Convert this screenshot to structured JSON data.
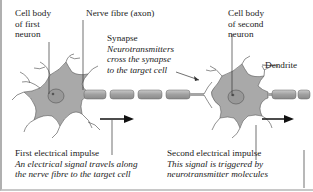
{
  "diagram": {
    "labels": {
      "cell_body_first": [
        "Cell body",
        "of first",
        "neuron"
      ],
      "nerve_fibre": "Nerve fibre (axon)",
      "synapse_title": "Synapse",
      "synapse_desc": [
        "Neurotransmitters",
        "cross the synapse",
        "to the target cell"
      ],
      "cell_body_second": [
        "Cell body",
        "of second",
        "neuron"
      ],
      "dendrite": "Dendrite",
      "first_impulse_title": "First electrical impulse",
      "first_impulse_desc": [
        "An electrical signal travels along",
        "the nerve fibre to the target cell"
      ],
      "second_impulse_title": "Second electrical impulse",
      "second_impulse_desc": [
        "This signal is triggered by",
        "neurotransmitter molecules"
      ]
    },
    "colors": {
      "cell_fill": "#a9a9a9",
      "nucleus_fill": "#8f8f8f",
      "axon_fill": "#a5a5a5",
      "line": "#333333",
      "text": "#222222"
    }
  }
}
